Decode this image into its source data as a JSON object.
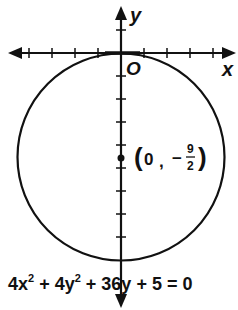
{
  "diagram": {
    "axes": {
      "x_label": "x",
      "y_label": "y",
      "origin_label": "O"
    },
    "circle": {
      "center_label_open": "(",
      "center_x": "0",
      "center_sep": ",",
      "center_minus": "−",
      "center_y_num": "9",
      "center_y_den": "2",
      "center_label_close": ")"
    },
    "equation": {
      "t1": "4x",
      "e1": "2",
      "t2": " + 4y",
      "e2": "2",
      "t3": " + 36y + 5 = 0"
    }
  }
}
